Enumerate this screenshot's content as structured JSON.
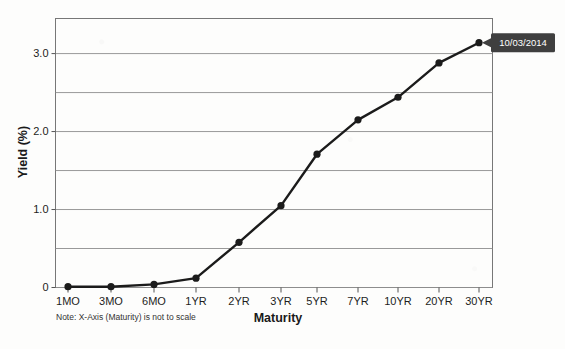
{
  "chart_data": {
    "type": "line",
    "title": "",
    "xlabel": "Maturity",
    "ylabel": "Yield (%)",
    "categories": [
      "1MO",
      "3MO",
      "6MO",
      "1YR",
      "2YR",
      "3YR",
      "5YR",
      "7YR",
      "10YR",
      "20YR",
      "30YR"
    ],
    "values": [
      0.01,
      0.01,
      0.04,
      0.12,
      0.58,
      1.05,
      1.71,
      2.15,
      2.44,
      2.88,
      3.14
    ],
    "series": [
      {
        "name": "10/03/2014",
        "values": [
          0.01,
          0.01,
          0.04,
          0.12,
          0.58,
          1.05,
          1.71,
          2.15,
          2.44,
          2.88,
          3.14
        ]
      }
    ],
    "ylim": [
      0,
      3.45
    ],
    "y_ticks_major": [
      "0",
      "1.0",
      "2.0",
      "3.0"
    ],
    "y_ticks_major_values": [
      0,
      1.0,
      2.0,
      3.0
    ],
    "y_gridlines": [
      0,
      0.5,
      1.0,
      1.5,
      2.0,
      2.5,
      3.0
    ],
    "grid": true,
    "legend_position": "none",
    "annotation": "10/03/2014",
    "note": "Note: X-Axis (Maturity) is not to scale"
  },
  "colors": {
    "line": "#1b1b1b",
    "marker": "#1b1b1b",
    "grid": "#8d8d8d",
    "axis": "#555555",
    "badge_background": "#3f3f3f",
    "badge_text": "#ffffff",
    "background": "#fdfdfc"
  },
  "labels": {
    "y_axis_title": "Yield (%)",
    "x_axis_title": "Maturity",
    "note": "Note: X-Axis (Maturity) is not to scale",
    "tooltip": "10/03/2014"
  }
}
